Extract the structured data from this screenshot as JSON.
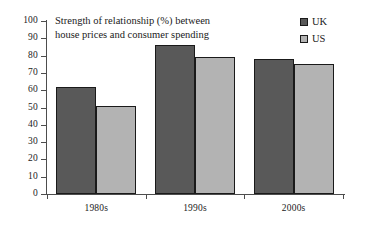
{
  "chart_data": {
    "type": "bar",
    "title": "Strength of relationship (%) between house prices and consumer spending",
    "title_line1": "Strength of relationship (%) between",
    "title_line2": "house prices and consumer spending",
    "xlabel": "",
    "ylabel": "",
    "categories": [
      "1980s",
      "1990s",
      "2000s"
    ],
    "series": [
      {
        "name": "UK",
        "color": "#595959",
        "values": [
          62,
          86,
          78
        ]
      },
      {
        "name": "US",
        "color": "#b3b3b3",
        "values": [
          51,
          79,
          75
        ]
      }
    ],
    "ylim": [
      0,
      100
    ],
    "ytick_step": 10,
    "yticks": [
      100,
      90,
      80,
      70,
      60,
      50,
      40,
      30,
      20,
      10,
      0
    ],
    "ytick_labels": [
      "100",
      "90",
      "80",
      "70",
      "60",
      "50",
      "40",
      "30",
      "20",
      "10",
      "0"
    ],
    "grid": false,
    "legend_position": "top-right",
    "legend": [
      {
        "label": "UK",
        "swatch": "uk"
      },
      {
        "label": "US",
        "swatch": "us"
      }
    ]
  }
}
